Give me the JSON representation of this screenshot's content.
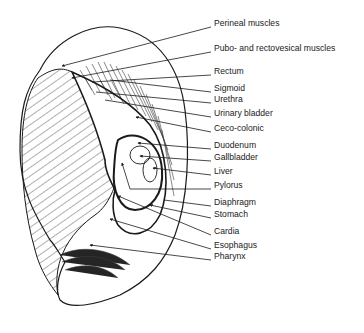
{
  "diagram": {
    "type": "anatomical ear reflexology map",
    "colors": {
      "ink": "#1a1a1a",
      "background": "#ffffff"
    },
    "labels": [
      {
        "text": "Perineal muscles",
        "y": 23,
        "target": [
          60,
          66
        ]
      },
      {
        "text": "Pubo- and rectovesical muscles",
        "y": 48,
        "target": [
          72,
          78
        ]
      },
      {
        "text": "Rectum",
        "y": 71,
        "target": [
          92,
          82
        ]
      },
      {
        "text": "Sigmoid",
        "y": 88,
        "target": [
          110,
          80
        ]
      },
      {
        "text": "Urethra",
        "y": 99,
        "target": [
          96,
          92
        ]
      },
      {
        "text": "Urinary bladder",
        "y": 113,
        "target": [
          105,
          100
        ]
      },
      {
        "text": "Ceco-colonic",
        "y": 128,
        "target": [
          136,
          117
        ]
      },
      {
        "text": "Duodenum",
        "y": 145,
        "target": [
          135,
          132
        ]
      },
      {
        "text": "Gallbladder",
        "y": 157,
        "target": [
          140,
          143
        ]
      },
      {
        "text": "Liver",
        "y": 171,
        "target": [
          150,
          156
        ]
      },
      {
        "text": "Pylorus",
        "y": 185,
        "target": [
          122,
          163
        ]
      },
      {
        "text": "Diaphragm",
        "y": 202,
        "target": [
          118,
          196
        ]
      },
      {
        "text": "Stomach",
        "y": 214,
        "target": [
          150,
          206
        ]
      },
      {
        "text": "Cardia",
        "y": 231,
        "target": [
          110,
          219
        ]
      },
      {
        "text": "Esophagus",
        "y": 245,
        "target": [
          92,
          234
        ]
      },
      {
        "text": "Pharynx",
        "y": 256,
        "target": [
          90,
          248
        ]
      }
    ]
  }
}
